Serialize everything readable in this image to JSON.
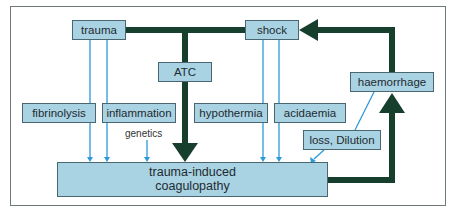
{
  "diagram": {
    "nodes": {
      "trauma": "trauma",
      "shock": "shock",
      "atc": "ATC",
      "haemorrhage": "haemorrhage",
      "fibrinolysis": "fibrinolysis",
      "inflammation": "inflammation",
      "hypothermia": "hypothermia",
      "acidaemia": "acidaemia",
      "loss_dilution": "loss, Dilution",
      "tic_line1": "trauma-induced",
      "tic_line2": "coagulopathy"
    },
    "labels": {
      "genetics": "genetics"
    },
    "colors": {
      "box_fill": "#a9d3e3",
      "thick_arrow": "#173f2e",
      "thin_arrow": "#2a9ad8"
    }
  }
}
